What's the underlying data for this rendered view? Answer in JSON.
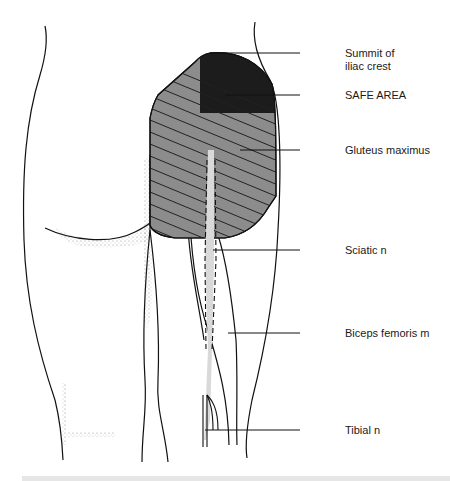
{
  "figure": {
    "colors": {
      "outline": "#111111",
      "gluteus_fill": "#8c8c8c",
      "safe_area_fill": "#1c1c1c",
      "sciatic_nerve": "#d9d9d9",
      "stipple": "#555555",
      "background": "#ffffff"
    }
  },
  "labels": [
    {
      "id": "summit",
      "text_line1": "Summit of",
      "text_line2": "iliac crest"
    },
    {
      "id": "safe_area",
      "text": "SAFE AREA"
    },
    {
      "id": "gluteus",
      "text": "Gluteus maximus"
    },
    {
      "id": "sciatic",
      "text": "Sciatic n"
    },
    {
      "id": "biceps",
      "text": "Biceps femoris m"
    },
    {
      "id": "tibial",
      "text": "Tibial n"
    }
  ]
}
